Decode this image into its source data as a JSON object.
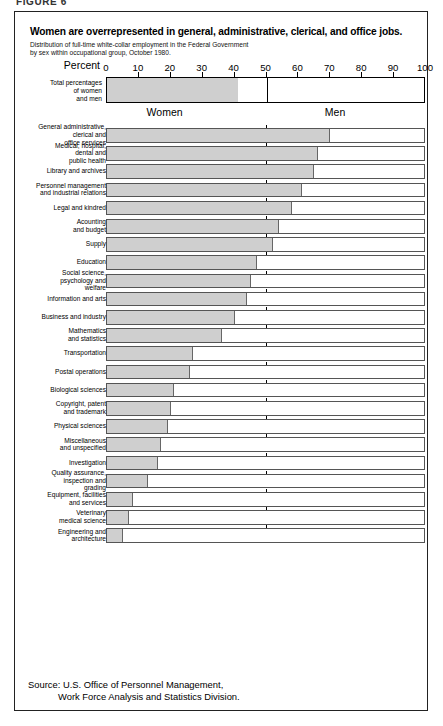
{
  "figure_tag": "FIGURE 6",
  "title": "Women are overrepresented in general, administrative, clerical, and office jobs.",
  "subtitle_line1": "Distribution of full-time white-collar employment in the Federal Government",
  "subtitle_line2": "by sex within occupational group, October 1980.",
  "axis_title": "Percent",
  "total_label_line1": "Total percentages",
  "total_label_line2": "of women",
  "total_label_line3": "and men",
  "women_label": "Women",
  "men_label": "Men",
  "source_line1": "Source: U.S. Office of Personnel Management,",
  "source_line2": "Work Force Analysis and Statistics Division.",
  "colors": {
    "women_fill": "#cfcfcf",
    "men_fill": "#ffffff",
    "frame": "#222222",
    "axis": "#000000"
  },
  "chart_data": {
    "type": "bar",
    "orientation": "horizontal",
    "stacked": true,
    "title": "Women are overrepresented in general, administrative, clerical, and office jobs.",
    "subtitle": "Distribution of full-time white-collar employment in the Federal Government by sex within occupational group, October 1980.",
    "xlabel": "Percent",
    "ylabel": "",
    "xlim": [
      0,
      100
    ],
    "xticks": [
      0,
      10,
      20,
      30,
      40,
      50,
      60,
      70,
      80,
      90,
      100
    ],
    "xticklabels": [
      "0",
      "10",
      "20",
      "30",
      "40",
      "50",
      "60",
      "70",
      "80",
      "90",
      "100"
    ],
    "grid": false,
    "legend": [
      "Women",
      "Men"
    ],
    "legend_position": "under-total-bar",
    "total": {
      "label": "Total percentages of women and men",
      "women": 41,
      "men": 59
    },
    "categories": [
      "General administrative, clerical and office services",
      "Medical, hospital, dental and public health",
      "Library and archives",
      "Personnel management and industrial relations",
      "Legal and kindred",
      "Acounting and budget",
      "Supply",
      "Education",
      "Social science, psychology and welfare",
      "Information and arts",
      "Business and industry",
      "Mathematics and statistics",
      "Transportation",
      "Postal operations",
      "Biological sciences",
      "Copyright, patent and trademark",
      "Physical sciences",
      "Miscellaneous and unspecified",
      "Investigation",
      "Quality assurance, inspection and grading",
      "Equipment, facilities and services",
      "Veterinary medical science",
      "Engineering and architecture"
    ],
    "series": [
      {
        "name": "Women",
        "values": [
          70,
          66,
          65,
          61,
          58,
          54,
          52,
          47,
          45,
          44,
          40,
          36,
          27,
          26,
          21,
          20,
          19,
          17,
          16,
          13,
          8,
          7,
          5
        ]
      },
      {
        "name": "Men",
        "values": [
          30,
          34,
          35,
          39,
          42,
          46,
          48,
          53,
          55,
          56,
          60,
          64,
          73,
          74,
          79,
          80,
          81,
          83,
          84,
          87,
          92,
          93,
          95
        ]
      }
    ]
  },
  "rows": [
    {
      "label_lines": [
        "General administrative,",
        "clerical and",
        "office services"
      ],
      "women": 70
    },
    {
      "label_lines": [
        "Medical, hospital,",
        "dental and",
        "public health"
      ],
      "women": 66
    },
    {
      "label_lines": [
        "Library and archives"
      ],
      "women": 65
    },
    {
      "label_lines": [
        "Personnel management",
        "and industrial relations"
      ],
      "women": 61
    },
    {
      "label_lines": [
        "Legal and kindred"
      ],
      "women": 58
    },
    {
      "label_lines": [
        "Acounting",
        "and budget"
      ],
      "women": 54
    },
    {
      "label_lines": [
        "Supply"
      ],
      "women": 52
    },
    {
      "label_lines": [
        "Education"
      ],
      "women": 47
    },
    {
      "label_lines": [
        "Social science,",
        "psychology and",
        "welfare"
      ],
      "women": 45
    },
    {
      "label_lines": [
        "Information and arts"
      ],
      "women": 44
    },
    {
      "label_lines": [
        "Business and industry"
      ],
      "women": 40
    },
    {
      "label_lines": [
        "Mathematics",
        "and statistics"
      ],
      "women": 36
    },
    {
      "label_lines": [
        "Transportation"
      ],
      "women": 27
    },
    {
      "label_lines": [
        "Postal operations"
      ],
      "women": 26
    },
    {
      "label_lines": [
        "Biological sciences"
      ],
      "women": 21
    },
    {
      "label_lines": [
        "Copyright, patent",
        "and trademark"
      ],
      "women": 20
    },
    {
      "label_lines": [
        "Physical sciences"
      ],
      "women": 19
    },
    {
      "label_lines": [
        "Miscellaneous",
        "and unspecified"
      ],
      "women": 17
    },
    {
      "label_lines": [
        "Investigation"
      ],
      "women": 16
    },
    {
      "label_lines": [
        "Quality assurance,",
        "inspection and",
        "grading"
      ],
      "women": 13
    },
    {
      "label_lines": [
        "Equipment, facilities",
        "and services"
      ],
      "women": 8
    },
    {
      "label_lines": [
        "Veterinary",
        "medical science"
      ],
      "women": 7
    },
    {
      "label_lines": [
        "Engineering and",
        "architecture"
      ],
      "women": 5
    }
  ]
}
